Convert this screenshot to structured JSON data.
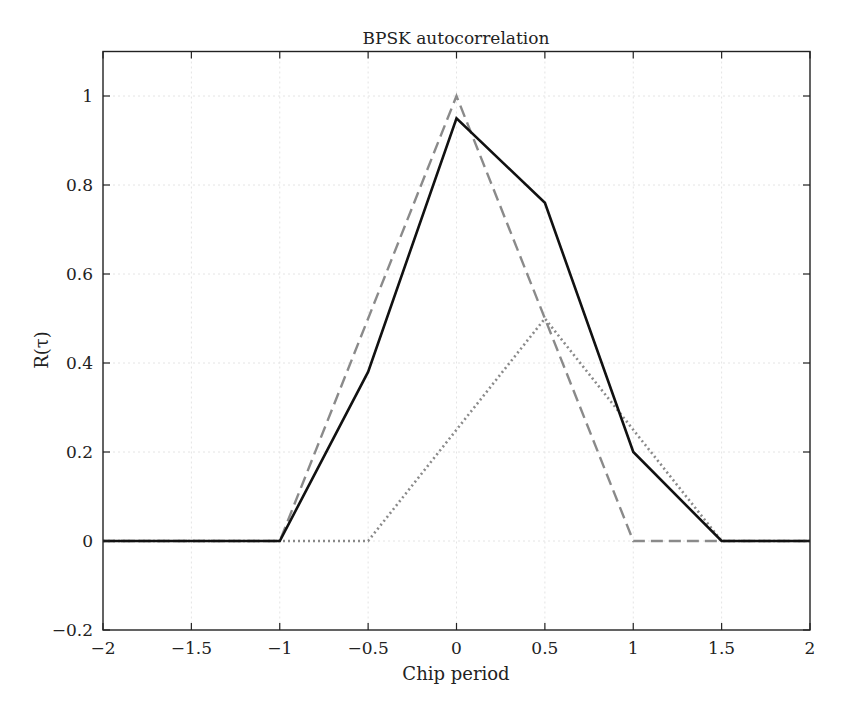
{
  "chart_data": {
    "type": "line",
    "title": "BPSK autocorrelation",
    "xlabel": "Chip period",
    "ylabel": "R(τ)",
    "xlim": [
      -2,
      2
    ],
    "ylim": [
      -0.2,
      1.1
    ],
    "xticks": [
      -2,
      -1.5,
      -1,
      -0.5,
      0,
      0.5,
      1,
      1.5,
      2
    ],
    "xtick_labels": [
      "−2",
      "−1.5",
      "−1",
      "−0.5",
      "0",
      "0.5",
      "1",
      "1.5",
      "2"
    ],
    "yticks": [
      -0.2,
      0,
      0.2,
      0.4,
      0.6,
      0.8,
      1
    ],
    "ytick_labels": [
      "−0.2",
      "0",
      "0.2",
      "0.4",
      "0.6",
      "0.8",
      "1"
    ],
    "grid": true,
    "legend": null,
    "series": [
      {
        "name": "solid",
        "style": "solid",
        "color": "#111111",
        "x": [
          -2,
          -1,
          -0.5,
          0,
          0.5,
          1,
          1.5,
          2
        ],
        "y": [
          0,
          0,
          0.38,
          0.95,
          0.76,
          0.2,
          0,
          0
        ]
      },
      {
        "name": "dashed",
        "style": "dashed",
        "color": "#8a8a8a",
        "x": [
          -2,
          -1,
          0,
          1,
          1.5,
          2
        ],
        "y": [
          0,
          0,
          1.0,
          0,
          0,
          0
        ]
      },
      {
        "name": "dotted",
        "style": "dotted",
        "color": "#8a8a8a",
        "x": [
          -2,
          -0.5,
          0.5,
          1.5,
          2
        ],
        "y": [
          0,
          0,
          0.5,
          0,
          0
        ]
      }
    ]
  },
  "colors": {
    "axis": "#222222",
    "grid": "#e4e4e4"
  }
}
